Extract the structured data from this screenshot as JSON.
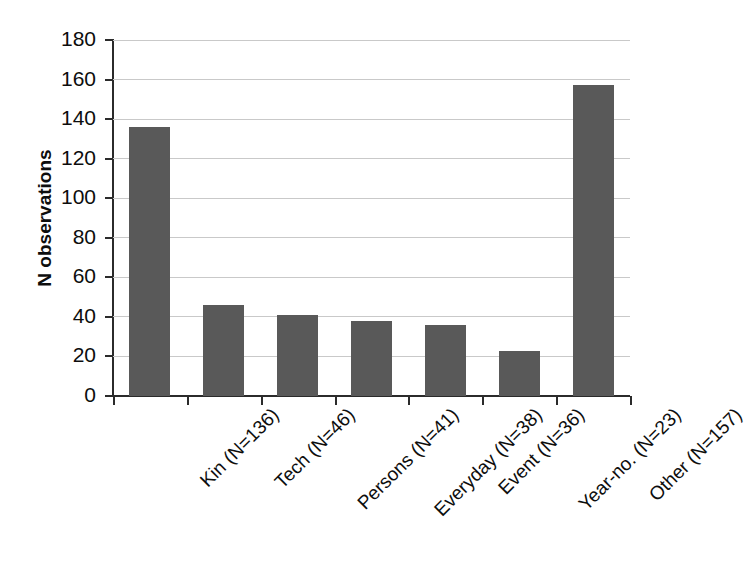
{
  "chart_data": {
    "type": "bar",
    "title": "",
    "subtitle": "",
    "xlabel": "",
    "ylabel": "N observations",
    "categories": [
      "Kin (N=136)",
      "Tech (N=46)",
      "Persons (N=41)",
      "Everyday (N=38)",
      "Event (N=36)",
      "Year-no. (N=23)",
      "Other (N=157)"
    ],
    "category_names": [
      "Kin",
      "Tech",
      "Persons",
      "Everyday",
      "Event",
      "Year-no.",
      "Other"
    ],
    "values": [
      136,
      46,
      41,
      38,
      36,
      23,
      157
    ],
    "ylim": [
      0,
      180
    ],
    "ytick_values": [
      0,
      20,
      40,
      60,
      80,
      100,
      120,
      140,
      160,
      180
    ],
    "ytick_labels": [
      "0",
      "20",
      "40",
      "60",
      "80",
      "100",
      "120",
      "140",
      "160",
      "180"
    ],
    "grid": "horizontal",
    "legend": "none",
    "bar_color": "#595959",
    "grid_color": "#c9c9c9",
    "axis_color": "#2b2b2b",
    "background_color": "#ffffff",
    "xtick_label_rotation": -45
  }
}
